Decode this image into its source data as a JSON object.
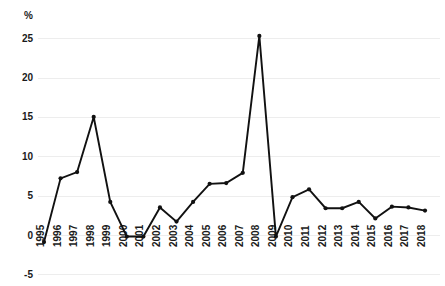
{
  "chart_data": {
    "type": "line",
    "title": "",
    "xlabel": "",
    "ylabel": "",
    "unit_label": "%",
    "grid": true,
    "legend": "none",
    "ylim": [
      -5,
      27
    ],
    "yticks": [
      -5,
      0,
      5,
      10,
      15,
      20,
      25
    ],
    "ytick_labels": [
      "-5",
      "0",
      "5",
      "10",
      "15",
      "20",
      "25"
    ],
    "categories": [
      "1995",
      "1996",
      "1997",
      "1998",
      "1999",
      "2000",
      "2001",
      "2002",
      "2003",
      "2004",
      "2005",
      "2006",
      "2007",
      "2008",
      "2009",
      "2010",
      "2011",
      "2012",
      "2013",
      "2014",
      "2015",
      "2016",
      "2017",
      "2018"
    ],
    "values": [
      -0.9,
      7.2,
      8.0,
      15.0,
      4.2,
      -0.2,
      -0.2,
      3.5,
      1.7,
      4.2,
      6.5,
      6.6,
      7.9,
      25.3,
      -0.2,
      4.8,
      5.8,
      3.4,
      3.4,
      4.2,
      2.1,
      3.6,
      3.5,
      3.1
    ],
    "series_color": "#111111",
    "grid_color": "#ededed",
    "background_color": "#ffffff"
  }
}
